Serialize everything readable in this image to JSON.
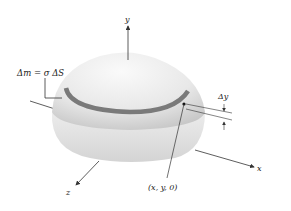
{
  "figure": {
    "labels": {
      "y_axis": "y",
      "x_axis": "x",
      "z_axis": "z",
      "mass_element": "Δm = σ  ΔS",
      "delta_y": "Δy",
      "point": "(x,  y,  0)"
    },
    "colors": {
      "shell_light": "#f4f4f4",
      "shell_shade": "#d0d0d0",
      "band": "#7a7a7a",
      "lines": "#333333"
    }
  }
}
